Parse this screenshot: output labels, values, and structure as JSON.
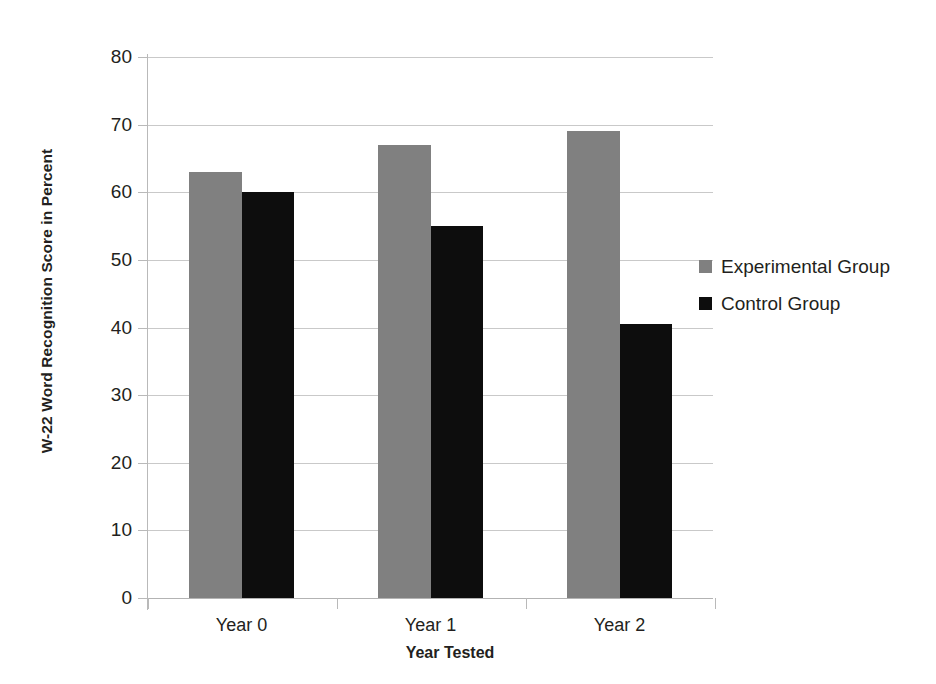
{
  "chart_data": {
    "type": "bar",
    "title": "",
    "xlabel": "Year Tested",
    "ylabel": "W-22 Word Recognition Score in Percent",
    "categories": [
      "Year 0",
      "Year 1",
      "Year 2"
    ],
    "series": [
      {
        "name": "Experimental Group",
        "color": "#808080",
        "values": [
          63,
          67,
          69
        ]
      },
      {
        "name": "Control Group",
        "color": "#0d0d0d",
        "values": [
          60,
          55,
          40.5
        ]
      }
    ],
    "ylim": [
      0,
      80
    ],
    "ytick_labels": [
      "0",
      "10",
      "20",
      "30",
      "40",
      "50",
      "60",
      "70",
      "80"
    ],
    "ytick_values": [
      0,
      10,
      20,
      30,
      40,
      50,
      60,
      70,
      80
    ],
    "grid": true,
    "legend_position": "right"
  },
  "axis": {
    "y_title": "W-22 Word Recognition Score in Percent",
    "x_title": "Year Tested"
  },
  "legend": {
    "entries": [
      {
        "label": "Experimental Group",
        "swatch": "experimental"
      },
      {
        "label": "Control Group",
        "swatch": "control"
      }
    ]
  },
  "colors": {
    "experimental": "#808080",
    "control": "#0d0d0d",
    "gridline": "#c9c9c9",
    "axis": "#b9b9b9",
    "text": "#231f20",
    "background": "#ffffff"
  }
}
